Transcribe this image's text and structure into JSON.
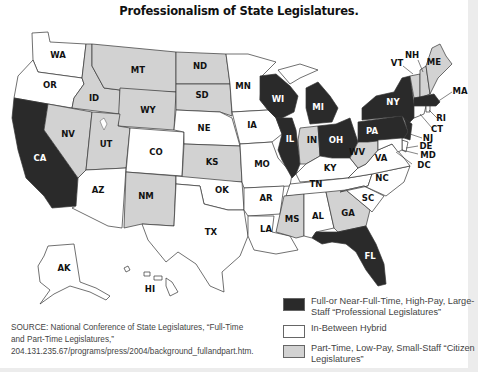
{
  "title": "Professionalism of State Legislatures.",
  "colors": {
    "professional": "#2a2a2a",
    "hybrid": "#ffffff",
    "citizen": "#d2d2d2",
    "border": "#333333"
  },
  "legend": {
    "items": [
      {
        "key": "professional",
        "label": "Full-or Near-Full-Time, High-Pay, Large-Staff “Professional Legislatures”",
        "color": "#2a2a2a"
      },
      {
        "key": "hybrid",
        "label": "In-Between Hybrid",
        "color": "#ffffff"
      },
      {
        "key": "citizen",
        "label": "Part-Time, Low-Pay, Small-Staff “Citizen Legislatures”",
        "color": "#d2d2d2"
      }
    ]
  },
  "source": "SOURCE: National Conference of State Legislatures, “Full-Time and Part-Time Legislatures,” 204.131.235.67/programs/press/2004/background_fullandpart.htm.",
  "categories": {
    "professional": [
      "CA",
      "WI",
      "MI",
      "IL",
      "OH",
      "PA",
      "NY",
      "NJ",
      "MA",
      "FL"
    ],
    "hybrid": [
      "WA",
      "OR",
      "AZ",
      "CO",
      "NE",
      "MN",
      "IA",
      "MO",
      "OK",
      "TX",
      "AR",
      "LA",
      "KY",
      "TN",
      "AL",
      "NC",
      "SC",
      "VA",
      "DE",
      "MD",
      "CT",
      "RI",
      "AK",
      "HI",
      "DC"
    ],
    "citizen": [
      "ID",
      "MT",
      "WY",
      "NV",
      "UT",
      "ND",
      "SD",
      "KS",
      "NM",
      "IN",
      "WV",
      "MS",
      "GA",
      "VT",
      "NH",
      "ME"
    ]
  },
  "state_labels": {
    "WA": "WA",
    "OR": "OR",
    "CA": "CA",
    "ID": "ID",
    "NV": "NV",
    "MT": "MT",
    "WY": "WY",
    "UT": "UT",
    "AZ": "AZ",
    "CO": "CO",
    "NM": "NM",
    "ND": "ND",
    "SD": "SD",
    "NE": "NE",
    "KS": "KS",
    "OK": "OK",
    "TX": "TX",
    "MN": "MN",
    "IA": "IA",
    "MO": "MO",
    "AR": "AR",
    "LA": "LA",
    "WI": "WI",
    "IL": "IL",
    "MI": "MI",
    "IN": "IN",
    "OH": "OH",
    "KY": "KY",
    "TN": "TN",
    "MS": "MS",
    "AL": "AL",
    "GA": "GA",
    "FL": "FL",
    "SC": "SC",
    "NC": "NC",
    "VA": "VA",
    "WV": "WV",
    "PA": "PA",
    "NY": "NY",
    "VT": "VT",
    "NH": "NH",
    "ME": "ME",
    "MA": "MA",
    "RI": "RI",
    "CT": "CT",
    "NJ": "NJ",
    "DE": "DE",
    "MD": "MD",
    "DC": "DC",
    "AK": "AK",
    "HI": "HI"
  }
}
